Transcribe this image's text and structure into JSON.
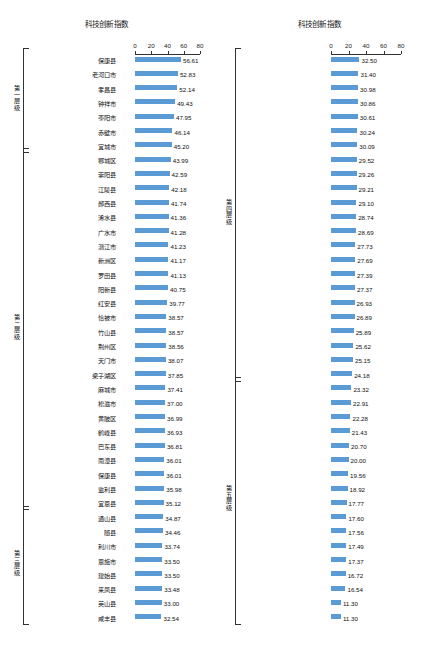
{
  "chart_data": [
    {
      "type": "bar",
      "title": "科技创新指数",
      "orientation": "horizontal",
      "xlabel": "",
      "ylabel": "",
      "xlim": [
        0,
        80
      ],
      "xticks": [
        0,
        20,
        40,
        60,
        80
      ],
      "grid": false,
      "bar_color": "#5b9bd5",
      "categories": [
        "江夏区",
        "蔡甸区",
        "大冶市",
        "远安县",
        "枝江市",
        "东宝区",
        "宜都市",
        "房县",
        "石首市",
        "洪湖市",
        "安陆市",
        "夷陵区",
        "当阳市",
        "襄州区",
        "谷城县",
        "老河口市",
        "华容区",
        "京山",
        "武汉市",
        "五峰土家族自治县",
        "汉川市",
        "嘉鱼县",
        "云梦县",
        "枣阳市",
        "沙洋县",
        "郧县区",
        "秭归县",
        "通城县",
        "咸安区",
        "京山市",
        "长阳土家族自治县",
        "兴山县",
        "公安县",
        "秉春县",
        "竹溪县",
        "黄梅县",
        "大悟县",
        "团风县",
        "丹江口市",
        "黄冈区"
      ],
      "values": [
        56.61,
        52.83,
        52.14,
        49.43,
        47.95,
        46.14,
        45.2,
        43.99,
        42.59,
        42.18,
        41.74,
        41.36,
        41.28,
        41.23,
        41.17,
        41.13,
        40.75,
        39.77,
        38.57,
        38.57,
        38.56,
        38.07,
        37.85,
        37.41,
        37.0,
        36.99,
        36.93,
        36.81,
        36.01,
        36.01,
        35.98,
        35.12,
        34.87,
        34.46,
        33.74,
        33.5,
        33.5,
        33.48,
        33.0,
        32.54
      ],
      "groups": [
        {
          "label": "第一层级",
          "start": 0,
          "end": 6
        },
        {
          "label": "第二层级",
          "start": 7,
          "end": 31
        },
        {
          "label": "第三层级",
          "start": 32,
          "end": 39
        }
      ]
    },
    {
      "type": "bar",
      "title": "科技创新指数",
      "orientation": "horizontal",
      "xlabel": "",
      "ylabel": "",
      "xlim": [
        0,
        80
      ],
      "xticks": [
        0,
        20,
        40,
        60,
        80
      ],
      "grid": false,
      "bar_color": "#5b9bd5",
      "categories": [
        "保康县",
        "老河口市",
        "孝昌县",
        "钟祥市",
        "枣阳市",
        "赤壁市",
        "宜城市",
        "鄂城区",
        "崇阳县",
        "江陵县",
        "郧西县",
        "浠水县",
        "广水市",
        "潜江市",
        "新洲区",
        "罗田县",
        "阳新县",
        "红安县",
        "恰被市",
        "竹山县",
        "荆州区",
        "天门市",
        "梁子湖区",
        "麻城市",
        "松滋市",
        "黄陂区",
        "鹤峰县",
        "巴东县",
        "南漳县",
        "保康县",
        "监利县",
        "宜恩县",
        "通山县",
        "随县",
        "利川市",
        "恩施市",
        "建始县",
        "来凤县",
        "英山县",
        "咸丰县"
      ],
      "values": [
        32.5,
        31.4,
        30.98,
        30.86,
        30.61,
        30.24,
        30.09,
        29.52,
        29.26,
        29.21,
        29.1,
        28.74,
        28.69,
        27.73,
        27.69,
        27.39,
        27.37,
        26.93,
        26.89,
        25.89,
        25.62,
        25.15,
        24.18,
        23.32,
        22.91,
        22.28,
        21.43,
        20.7,
        20.0,
        19.56,
        18.92,
        17.77,
        17.6,
        17.56,
        17.49,
        17.37,
        16.72,
        16.54,
        11.3,
        11.3
      ],
      "groups": [
        {
          "label": "第四层级",
          "start": 0,
          "end": 22
        },
        {
          "label": "第五层级",
          "start": 23,
          "end": 39
        }
      ]
    }
  ]
}
